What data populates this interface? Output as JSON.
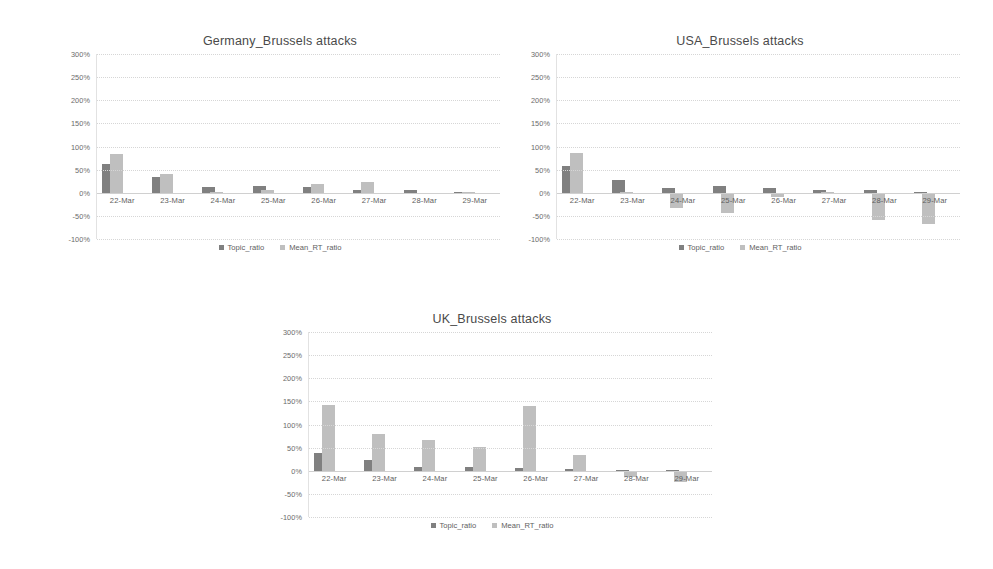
{
  "legend": {
    "topic_label": "Topic_ratio",
    "rt_label": "Mean_RT_ratio",
    "topic_color": "#808080",
    "rt_color": "#bfbfbf"
  },
  "axis": {
    "ticks": [
      "300%",
      "250%",
      "200%",
      "150%",
      "100%",
      "50%",
      "0%",
      "-50%",
      "-100%"
    ],
    "ymin": -100,
    "ymax": 300
  },
  "chart_data": [
    {
      "id": "germany",
      "type": "bar",
      "title": "Germany_Brussels attacks",
      "xlabel": "",
      "ylabel": "",
      "ylim": [
        -100,
        300
      ],
      "grid": true,
      "legend_position": "bottom",
      "categories": [
        "22-Mar",
        "23-Mar",
        "24-Mar",
        "25-Mar",
        "26-Mar",
        "27-Mar",
        "28-Mar",
        "29-Mar"
      ],
      "series": [
        {
          "name": "Topic_ratio",
          "values": [
            62,
            33,
            13,
            15,
            13,
            7,
            5,
            1
          ]
        },
        {
          "name": "Mean_RT_ratio",
          "values": [
            84,
            41,
            1,
            7,
            20,
            23,
            -3,
            1
          ]
        }
      ]
    },
    {
      "id": "usa",
      "type": "bar",
      "title": "USA_Brussels attacks",
      "xlabel": "",
      "ylabel": "",
      "ylim": [
        -100,
        300
      ],
      "grid": true,
      "legend_position": "bottom",
      "categories": [
        "22-Mar",
        "23-Mar",
        "24-Mar",
        "25-Mar",
        "26-Mar",
        "27-Mar",
        "28-Mar",
        "29-Mar"
      ],
      "series": [
        {
          "name": "Topic_ratio",
          "values": [
            57,
            28,
            11,
            14,
            10,
            5,
            5,
            0
          ]
        },
        {
          "name": "Mean_RT_ratio",
          "values": [
            85,
            2,
            -34,
            -43,
            -10,
            0,
            -58,
            -68
          ]
        }
      ]
    },
    {
      "id": "uk",
      "type": "bar",
      "title": "UK_Brussels attacks",
      "xlabel": "",
      "ylabel": "",
      "ylim": [
        -100,
        300
      ],
      "grid": true,
      "legend_position": "bottom",
      "categories": [
        "22-Mar",
        "23-Mar",
        "24-Mar",
        "25-Mar",
        "26-Mar",
        "27-Mar",
        "28-Mar",
        "29-Mar"
      ],
      "series": [
        {
          "name": "Topic_ratio",
          "values": [
            38,
            24,
            9,
            9,
            6,
            3,
            1,
            1
          ]
        },
        {
          "name": "Mean_RT_ratio",
          "values": [
            143,
            80,
            67,
            52,
            139,
            34,
            -13,
            -25
          ]
        }
      ]
    }
  ]
}
